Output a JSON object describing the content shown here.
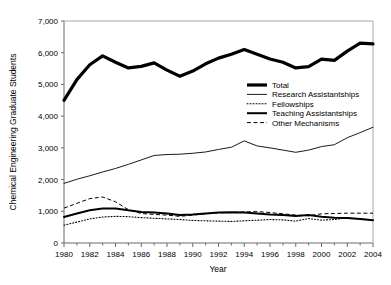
{
  "chart_data": {
    "type": "line",
    "title": "",
    "xlabel": "Year",
    "ylabel": "Chemical Engineering Graduate Students",
    "xlim": [
      1980,
      2004
    ],
    "ylim": [
      0,
      7000
    ],
    "grid": false,
    "legend_position": "center-right",
    "x": [
      1980,
      1981,
      1982,
      1983,
      1984,
      1985,
      1986,
      1987,
      1988,
      1989,
      1990,
      1991,
      1992,
      1993,
      1994,
      1995,
      1996,
      1997,
      1998,
      1999,
      2000,
      2001,
      2002,
      2003,
      2004
    ],
    "xticks": [
      "1980",
      "1982",
      "1984",
      "1986",
      "1988",
      "1990",
      "1992",
      "1994",
      "1996",
      "1998",
      "2000",
      "2002",
      "2004"
    ],
    "xtick_values": [
      1980,
      1982,
      1984,
      1986,
      1988,
      1990,
      1992,
      1994,
      1996,
      1998,
      2000,
      2002,
      2004
    ],
    "yticks": [
      "0",
      "1,000",
      "2,000",
      "3,000",
      "4,000",
      "5,000",
      "6,000",
      "7,000"
    ],
    "ytick_values": [
      0,
      1000,
      2000,
      3000,
      4000,
      5000,
      6000,
      7000
    ],
    "series": [
      {
        "name": "Total",
        "style": "thick-solid",
        "color": "#000000",
        "width": 3.2,
        "dash": "none",
        "values": [
          4500,
          5150,
          5620,
          5900,
          5700,
          5520,
          5570,
          5680,
          5450,
          5260,
          5420,
          5650,
          5830,
          5950,
          6100,
          5950,
          5800,
          5700,
          5520,
          5560,
          5800,
          5760,
          6050,
          6300,
          6280
        ]
      },
      {
        "name": "Research Assistantships",
        "style": "thin-solid",
        "color": "#000000",
        "width": 0.9,
        "dash": "none",
        "values": [
          1880,
          2010,
          2120,
          2240,
          2350,
          2480,
          2620,
          2760,
          2790,
          2800,
          2830,
          2870,
          2950,
          3020,
          3220,
          3060,
          3000,
          2930,
          2860,
          2930,
          3040,
          3100,
          3320,
          3480,
          3650
        ]
      },
      {
        "name": "Fellowships",
        "style": "dotted",
        "color": "#000000",
        "width": 1.1,
        "dash": "1,2",
        "values": [
          560,
          660,
          760,
          820,
          840,
          830,
          800,
          780,
          760,
          740,
          710,
          700,
          690,
          680,
          700,
          720,
          740,
          730,
          690,
          770,
          720,
          740,
          790,
          760,
          720
        ]
      },
      {
        "name": "Teaching Assistantships",
        "style": "bold-solid",
        "color": "#000000",
        "width": 2.0,
        "dash": "none",
        "values": [
          820,
          930,
          1030,
          1090,
          1090,
          1030,
          980,
          960,
          930,
          880,
          900,
          930,
          960,
          970,
          960,
          930,
          900,
          880,
          850,
          880,
          830,
          800,
          790,
          760,
          720
        ]
      },
      {
        "name": "Other Mechanisms",
        "style": "dashed",
        "color": "#000000",
        "width": 1.0,
        "dash": "4,2.5",
        "values": [
          1100,
          1250,
          1400,
          1450,
          1300,
          1050,
          930,
          900,
          880,
          840,
          880,
          920,
          950,
          960,
          980,
          990,
          960,
          920,
          880,
          860,
          920,
          930,
          940,
          940,
          940
        ]
      }
    ]
  },
  "legend": {
    "items": [
      {
        "label": "Total"
      },
      {
        "label": "Research Assistantships"
      },
      {
        "label": "Fellowships"
      },
      {
        "label": "Teaching Assistantships"
      },
      {
        "label": "Other Mechanisms"
      }
    ]
  }
}
